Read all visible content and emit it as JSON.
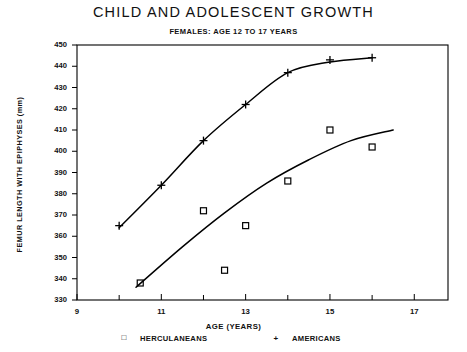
{
  "chart_data": {
    "type": "scatter",
    "title": "CHILD AND ADOLESCENT GROWTH",
    "subtitle": "FEMALES:  AGE 12 TO 17 YEARS",
    "xlabel": "AGE (YEARS)",
    "ylabel": "FEMUR LENGTH WITH EPIPHYSES (mm)",
    "xlim": [
      9,
      17.8
    ],
    "ylim": [
      330,
      450
    ],
    "xticks": [
      9,
      11,
      13,
      15,
      17
    ],
    "xtick_labels": [
      "9",
      "11",
      "13",
      "15",
      "17"
    ],
    "xminor_step": 1,
    "yticks": [
      330,
      340,
      350,
      360,
      370,
      380,
      390,
      400,
      410,
      420,
      430,
      440,
      450
    ],
    "ytick_labels": [
      "330",
      "340",
      "350",
      "360",
      "370",
      "380",
      "390",
      "400",
      "410",
      "420",
      "430",
      "440",
      "450"
    ],
    "grid": false,
    "legend_position": "below-axis",
    "series": [
      {
        "name": "HERCULANEANS",
        "marker": "square",
        "points": [
          {
            "x": 10.5,
            "y": 338
          },
          {
            "x": 12.0,
            "y": 372
          },
          {
            "x": 12.5,
            "y": 344
          },
          {
            "x": 13.0,
            "y": 365
          },
          {
            "x": 14.0,
            "y": 386
          },
          {
            "x": 15.0,
            "y": 410
          },
          {
            "x": 16.0,
            "y": 402
          }
        ],
        "trend_line": [
          {
            "x": 10.4,
            "y": 336
          },
          {
            "x": 11.5,
            "y": 355
          },
          {
            "x": 12.5,
            "y": 371
          },
          {
            "x": 13.5,
            "y": 385
          },
          {
            "x": 14.5,
            "y": 396
          },
          {
            "x": 15.5,
            "y": 405
          },
          {
            "x": 16.5,
            "y": 410
          }
        ]
      },
      {
        "name": "AMERICANS",
        "marker": "plus",
        "points": [
          {
            "x": 10.0,
            "y": 365
          },
          {
            "x": 11.0,
            "y": 384
          },
          {
            "x": 12.0,
            "y": 405
          },
          {
            "x": 13.0,
            "y": 422
          },
          {
            "x": 14.0,
            "y": 437
          },
          {
            "x": 15.0,
            "y": 443
          },
          {
            "x": 16.0,
            "y": 444
          }
        ],
        "trend_line": [
          {
            "x": 10.0,
            "y": 364
          },
          {
            "x": 11.0,
            "y": 384
          },
          {
            "x": 12.0,
            "y": 405
          },
          {
            "x": 13.0,
            "y": 422
          },
          {
            "x": 14.0,
            "y": 437
          },
          {
            "x": 15.0,
            "y": 442
          },
          {
            "x": 16.0,
            "y": 444
          }
        ]
      }
    ],
    "colors": {
      "axis": "#000000",
      "series_herculaneans": "#000000",
      "series_americans": "#000000",
      "background": "#ffffff"
    }
  },
  "legend": {
    "entries": [
      {
        "mark": "□",
        "label": "HERCULANEANS"
      },
      {
        "mark": "+",
        "label": "AMERICANS"
      }
    ]
  }
}
